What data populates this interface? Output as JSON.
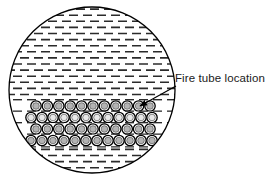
{
  "figure": {
    "name": "fire-tube-vessel-cross-section",
    "background_color": "#ffffff",
    "outline_color": "#000000",
    "annotation": {
      "label": "Fire tube location",
      "label_x": 175,
      "label_y": 82,
      "leader_from_x": 176,
      "leader_from_y": 86,
      "leader_to_x": 140,
      "leader_to_y": 106,
      "arrow_head": "arrow-head-icon"
    },
    "vessel": {
      "name": "vessel-shell-circle",
      "center_x": 92,
      "center_y": 90,
      "radius": 83,
      "stroke_width": 1.3,
      "fill": "#ffffff"
    },
    "liquid_hatch": {
      "name": "liquid-hatch-pattern",
      "dash_color": "#2b2b2b",
      "dash_length": 9,
      "dash_thickness": 1.6,
      "row_spacing": 6.1,
      "column_spacing": 14,
      "stagger_offset": 7,
      "description": "short horizontal dashes in offset brick rows representing liquid"
    },
    "tube_bank": {
      "name": "fire-tube-bank",
      "row_count": 4,
      "rows": [
        {
          "row_index": 1,
          "center_y": 106,
          "tube_count": 11,
          "first_x": 36,
          "pitch": 11.4,
          "outer_radius": 5.2,
          "inner_radius": 3.3,
          "outer_stroke": "#000000",
          "inner_fill": "#b3b3b3"
        },
        {
          "row_index": 2,
          "center_y": 117.5,
          "tube_count": 12,
          "first_x": 31,
          "pitch": 11.0,
          "outer_radius": 5.2,
          "inner_radius": 3.3,
          "outer_stroke": "#000000",
          "inner_fill": "#e8e8e8"
        },
        {
          "row_index": 3,
          "center_y": 129,
          "tube_count": 11,
          "first_x": 36,
          "pitch": 11.4,
          "outer_radius": 5.2,
          "inner_radius": 3.3,
          "outer_stroke": "#000000",
          "inner_fill": "#b3b3b3"
        },
        {
          "row_index": 4,
          "center_y": 140.5,
          "tube_count": 12,
          "first_x": 31,
          "pitch": 11.0,
          "outer_radius": 5.2,
          "inner_radius": 3.3,
          "outer_stroke": "#000000",
          "inner_fill": "#b3b3b3"
        }
      ]
    }
  }
}
